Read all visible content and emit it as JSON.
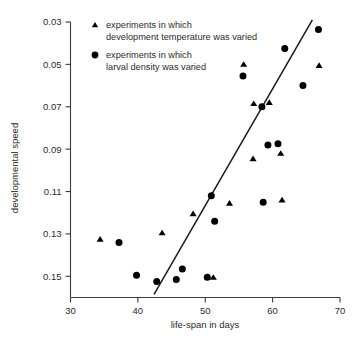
{
  "chart_data": {
    "type": "scatter",
    "title": "",
    "xlabel": "life-span in days",
    "ylabel": "developmental speed",
    "xlim": [
      30,
      70
    ],
    "ylim": [
      0.03,
      0.16
    ],
    "y_inverted": true,
    "grid": false,
    "xticks": [
      30,
      40,
      50,
      60,
      70
    ],
    "xtick_labels": [
      "30",
      "40",
      "50",
      "60",
      "70"
    ],
    "yticks": [
      0.03,
      0.05,
      0.07,
      0.09,
      0.11,
      0.13,
      0.15
    ],
    "ytick_labels": [
      "0.03",
      "0.05",
      "0.07",
      "0.09",
      "0.11",
      "0.13",
      "0.15"
    ],
    "legend_position": "top-left",
    "series": [
      {
        "name": "experiments in which development temperature was varied",
        "marker": "triangle",
        "color": "#000000",
        "points": [
          {
            "x": 34.4,
            "y": 0.1325
          },
          {
            "x": 43.6,
            "y": 0.1295
          },
          {
            "x": 48.2,
            "y": 0.1205
          },
          {
            "x": 51.2,
            "y": 0.1505
          },
          {
            "x": 53.6,
            "y": 0.1155
          },
          {
            "x": 55.7,
            "y": 0.05
          },
          {
            "x": 57.1,
            "y": 0.0945
          },
          {
            "x": 57.2,
            "y": 0.0685
          },
          {
            "x": 59.5,
            "y": 0.068
          },
          {
            "x": 61.2,
            "y": 0.092
          },
          {
            "x": 61.4,
            "y": 0.114
          },
          {
            "x": 66.9,
            "y": 0.0505
          }
        ]
      },
      {
        "name": "experiments in which larval density was varied",
        "marker": "circle",
        "color": "#000000",
        "points": [
          {
            "x": 37.2,
            "y": 0.134
          },
          {
            "x": 39.8,
            "y": 0.1495
          },
          {
            "x": 42.8,
            "y": 0.1525
          },
          {
            "x": 45.7,
            "y": 0.1515
          },
          {
            "x": 46.6,
            "y": 0.1465
          },
          {
            "x": 50.3,
            "y": 0.1505
          },
          {
            "x": 50.9,
            "y": 0.112
          },
          {
            "x": 51.4,
            "y": 0.124
          },
          {
            "x": 55.6,
            "y": 0.0555
          },
          {
            "x": 58.4,
            "y": 0.07
          },
          {
            "x": 58.6,
            "y": 0.115
          },
          {
            "x": 59.3,
            "y": 0.088
          },
          {
            "x": 60.8,
            "y": 0.0875
          },
          {
            "x": 61.8,
            "y": 0.0425
          },
          {
            "x": 64.5,
            "y": 0.06
          },
          {
            "x": 66.8,
            "y": 0.0335
          }
        ]
      }
    ],
    "trend_line": {
      "label": "regression line",
      "x_start": 42.4,
      "y_start": 0.1585,
      "x_end": 65.9,
      "y_end": 0.029
    }
  },
  "legend": {
    "entries": [
      {
        "marker": "triangle-icon",
        "line1": "experiments in which",
        "line2": "development temperature was varied"
      },
      {
        "marker": "circle-icon",
        "line1": "experiments in which",
        "line2": "larval density was varied"
      }
    ]
  }
}
